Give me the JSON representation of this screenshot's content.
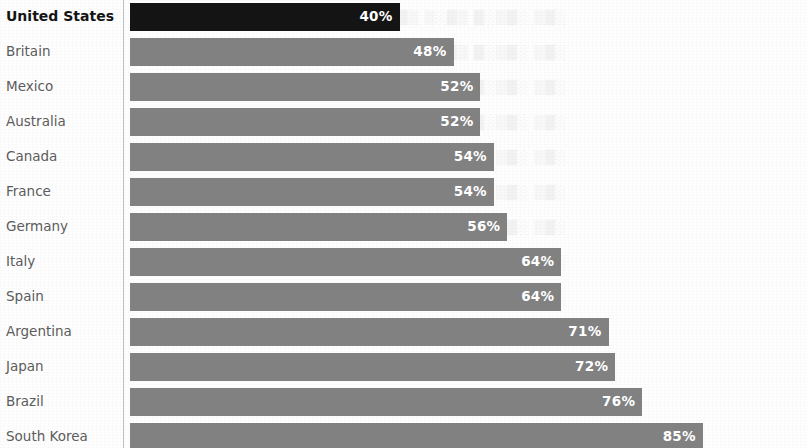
{
  "chart_data": {
    "type": "bar",
    "orientation": "horizontal",
    "title": "",
    "subtitle": "",
    "xlabel": "",
    "ylabel": "",
    "xlim": [
      0,
      100
    ],
    "grid": false,
    "legend": null,
    "value_suffix": "%",
    "categories": [
      "United States",
      "Britain",
      "Mexico",
      "Australia",
      "Canada",
      "France",
      "Germany",
      "Italy",
      "Spain",
      "Argentina",
      "Japan",
      "Brazil",
      "South Korea"
    ],
    "values": [
      40,
      48,
      52,
      52,
      54,
      54,
      56,
      64,
      64,
      71,
      72,
      76,
      85
    ],
    "value_labels": [
      "40%",
      "48%",
      "52%",
      "52%",
      "54%",
      "54%",
      "56%",
      "64%",
      "64%",
      "71%",
      "72%",
      "76%",
      "85%"
    ],
    "highlight_index": 0,
    "series": [
      {
        "name": "",
        "values": [
          40,
          48,
          52,
          52,
          54,
          54,
          56,
          64,
          64,
          71,
          72,
          76,
          85
        ]
      }
    ],
    "colors": {
      "bar": "#7f7f7f",
      "bar_highlight": "#101010",
      "value_label": "#ffffff",
      "category_label": "#5c5c5c",
      "category_label_highlight": "#141414",
      "background": "#fefefe",
      "axis_line": "#8c8c8c"
    }
  },
  "rows": [
    {
      "label": "United States",
      "value": 40,
      "value_label": "40%",
      "highlight": true
    },
    {
      "label": "Britain",
      "value": 48,
      "value_label": "48%",
      "highlight": false
    },
    {
      "label": "Mexico",
      "value": 52,
      "value_label": "52%",
      "highlight": false
    },
    {
      "label": "Australia",
      "value": 52,
      "value_label": "52%",
      "highlight": false
    },
    {
      "label": "Canada",
      "value": 54,
      "value_label": "54%",
      "highlight": false
    },
    {
      "label": "France",
      "value": 54,
      "value_label": "54%",
      "highlight": false
    },
    {
      "label": "Germany",
      "value": 56,
      "value_label": "56%",
      "highlight": false
    },
    {
      "label": "Italy",
      "value": 64,
      "value_label": "64%",
      "highlight": false
    },
    {
      "label": "Spain",
      "value": 64,
      "value_label": "64%",
      "highlight": false
    },
    {
      "label": "Argentina",
      "value": 71,
      "value_label": "71%",
      "highlight": false
    },
    {
      "label": "Japan",
      "value": 72,
      "value_label": "72%",
      "highlight": false
    },
    {
      "label": "Brazil",
      "value": 76,
      "value_label": "76%",
      "highlight": false
    },
    {
      "label": "South Korea",
      "value": 85,
      "value_label": "85%",
      "highlight": false
    }
  ],
  "layout": {
    "row_height": 35,
    "row_top_offset": 0,
    "bar_height": 28,
    "bar_left": 130,
    "scale_px_per_percent": 6.74
  }
}
